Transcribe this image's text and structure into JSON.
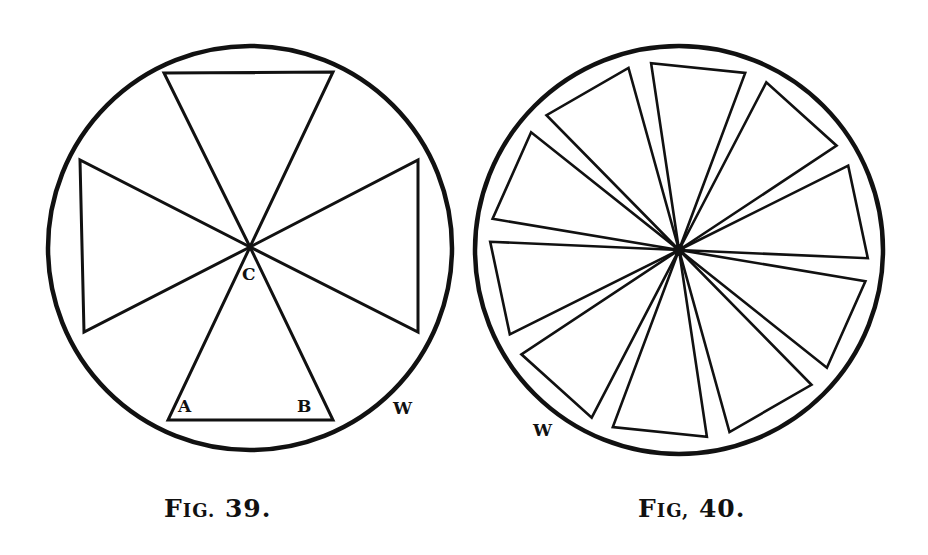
{
  "figures": [
    {
      "id": "fig39",
      "caption_initial": "F",
      "caption_rest": "IG.",
      "caption_number": "39.",
      "circle": {
        "cx": 250,
        "cy": 248,
        "r": 203
      },
      "center_label": "C",
      "corner_labels": [
        "A",
        "B"
      ],
      "rim_label": "W",
      "triangle_count": 4
    },
    {
      "id": "fig40",
      "caption_initial": "F",
      "caption_rest": "IG,",
      "caption_number": "40.",
      "circle": {
        "cx": 679,
        "cy": 250,
        "r": 205
      },
      "rim_label": "W",
      "triangle_count": 10
    }
  ],
  "colors": {
    "ink": "#111111",
    "paper": "#ffffff"
  }
}
